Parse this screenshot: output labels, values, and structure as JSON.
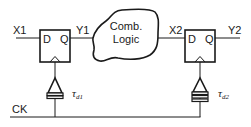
{
  "diagram": {
    "type": "flip-flop timing path with clock skew",
    "signals": {
      "x1": "X1",
      "y1": "Y1",
      "x2": "X2",
      "y2": "Y2",
      "clock": "CK"
    },
    "flip_flops": [
      {
        "id": "ff1",
        "d_label": "D",
        "q_label": "Q"
      },
      {
        "id": "ff2",
        "d_label": "D",
        "q_label": "Q"
      }
    ],
    "logic_block": {
      "line1": "Comb.",
      "line2": "Logic"
    },
    "delays": [
      {
        "symbol": "τ",
        "subscript": "d1"
      },
      {
        "symbol": "τ",
        "subscript": "d2"
      }
    ],
    "colors": {
      "stroke": "#1a1a1a",
      "background": "#ffffff"
    }
  }
}
